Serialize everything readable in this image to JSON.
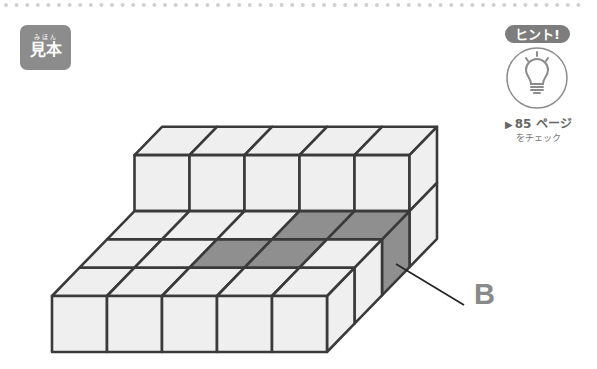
{
  "badge": {
    "ruby": "みほん",
    "title": "見本"
  },
  "hint": {
    "badge_text": "ヒント!",
    "icon": "lightbulb-icon",
    "arrow_icon": "triangle-right-icon",
    "page_text": "85 ページ",
    "check_text": "をチェック"
  },
  "figure": {
    "base": {
      "columns": 5,
      "rows": 4,
      "height": 1
    },
    "upper_tier": {
      "columns": 5,
      "row": "back",
      "height": 1
    },
    "highlighted": {
      "row2_top_columns": [
        4,
        5
      ],
      "row3_top_columns": [
        3,
        4
      ],
      "row2_right_side": true
    },
    "colors": {
      "face": "#efefef",
      "highlight": "#8f8f8f",
      "edge": "#3a3a3a"
    },
    "callout_label": "B"
  }
}
